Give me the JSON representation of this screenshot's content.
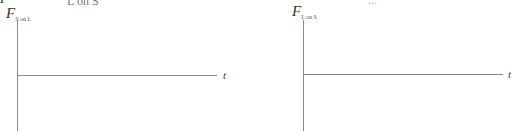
{
  "cropped_header": {
    "left_var": "F",
    "left_subscript": "L on S",
    "right_fragment": "..."
  },
  "graphs": [
    {
      "y_label": {
        "var": "F",
        "subscript": "S on L"
      },
      "x_label": "t"
    },
    {
      "y_label": {
        "var": "F",
        "subscript": "L on S"
      },
      "x_label": "t"
    }
  ],
  "chart_data": [
    {
      "type": "line",
      "title": "",
      "xlabel": "t",
      "ylabel": "F_S on L",
      "series": [],
      "grid": false,
      "note": "Blank axes: vertical force axis with horizontal time axis at zero"
    },
    {
      "type": "line",
      "title": "",
      "xlabel": "t",
      "ylabel": "F_L on S",
      "series": [],
      "grid": false,
      "note": "Blank axes: vertical force axis with horizontal time axis at zero"
    }
  ]
}
